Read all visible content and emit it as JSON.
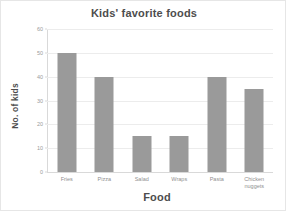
{
  "chart_data": {
    "type": "bar",
    "title": "Kids' favorite foods",
    "xlabel": "Food",
    "ylabel": "No. of kids",
    "categories": [
      "Fries",
      "Pizza",
      "Salad",
      "Wraps",
      "Pasta",
      "Chicken\nnuggets"
    ],
    "values": [
      50,
      40,
      15,
      15,
      40,
      35
    ],
    "ylim": [
      0,
      60
    ],
    "ytick_step": 10,
    "yticks": [
      60,
      50,
      40,
      30,
      20,
      10,
      0
    ],
    "ytick_labels": [
      "60",
      "50",
      "40",
      "30",
      "20",
      "10",
      "0"
    ],
    "grid": true,
    "legend": false,
    "bar_color": "#9a9a9a",
    "grid_color": "#ececec",
    "axis_color": "#d9d9d9",
    "title_color": "#4d4d4d",
    "tick_label_color": "#9b9b9b"
  }
}
